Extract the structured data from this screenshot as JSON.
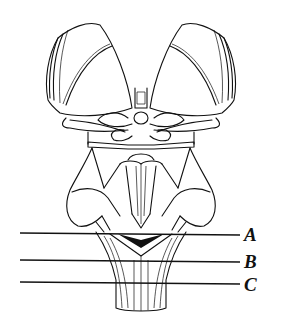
{
  "figure": {
    "levels": [
      {
        "label": "A",
        "y": 234
      },
      {
        "label": "B",
        "y": 261
      },
      {
        "label": "C",
        "y": 283
      }
    ],
    "colors": {
      "ink": "#111111",
      "background": "#ffffff"
    }
  }
}
